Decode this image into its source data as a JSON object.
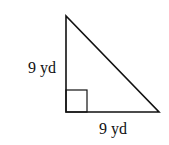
{
  "diagram": {
    "type": "right-triangle",
    "legs": {
      "vertical": {
        "label": "9 yd"
      },
      "horizontal": {
        "label": "9 yd"
      }
    },
    "right_angle_marker": true,
    "stroke_color": "#111111"
  }
}
